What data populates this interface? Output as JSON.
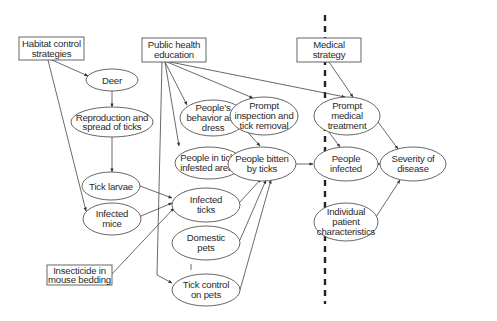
{
  "diagram": {
    "divider": {
      "style": "dashed",
      "x": 325
    },
    "nodes": {
      "habitat_control": {
        "shape": "box",
        "lines": [
          "Habitat control",
          "strategies"
        ]
      },
      "public_health": {
        "shape": "box",
        "lines": [
          "Public health",
          "education"
        ]
      },
      "medical_strategy": {
        "shape": "box",
        "lines": [
          "Medical",
          "strategy"
        ]
      },
      "insecticide": {
        "shape": "box",
        "lines": [
          "Insecticide in",
          "mouse bedding"
        ]
      },
      "deer": {
        "shape": "ellipse",
        "lines": [
          "Deer"
        ]
      },
      "reproduction": {
        "shape": "ellipse",
        "lines": [
          "Reproduction and",
          "spread of ticks"
        ]
      },
      "tick_larvae": {
        "shape": "ellipse",
        "lines": [
          "Tick larvae"
        ]
      },
      "infected_mice": {
        "shape": "ellipse",
        "lines": [
          "Infected",
          "mice"
        ]
      },
      "behavior_dress": {
        "shape": "ellipse",
        "lines": [
          "People’s",
          "behavior and",
          "dress"
        ]
      },
      "prompt_inspection": {
        "shape": "ellipse",
        "lines": [
          "Prompt",
          "inspection and",
          "tick removal"
        ]
      },
      "tick_infested_areas": {
        "shape": "ellipse",
        "lines": [
          "People in tick-",
          "infested areas"
        ]
      },
      "people_bitten": {
        "shape": "ellipse",
        "lines": [
          "People bitten",
          "by ticks"
        ]
      },
      "infected_ticks": {
        "shape": "ellipse",
        "lines": [
          "Infected",
          "ticks"
        ]
      },
      "domestic_pets": {
        "shape": "ellipse",
        "lines": [
          "Domestic",
          "pets"
        ]
      },
      "tick_control_pets": {
        "shape": "ellipse",
        "lines": [
          "Tick control",
          "on pets"
        ]
      },
      "prompt_medical": {
        "shape": "ellipse",
        "lines": [
          "Prompt",
          "medical",
          "treatment"
        ]
      },
      "people_infected": {
        "shape": "ellipse",
        "lines": [
          "People",
          "infected"
        ]
      },
      "severity": {
        "shape": "ellipse",
        "lines": [
          "Severity of",
          "disease"
        ]
      },
      "patient_characteristics": {
        "shape": "ellipse",
        "lines": [
          "Individual",
          "patient",
          "characteristics"
        ]
      }
    },
    "edges": [
      {
        "from": "habitat_control",
        "to": "deer"
      },
      {
        "from": "habitat_control",
        "to": "infected_mice"
      },
      {
        "from": "deer",
        "to": "reproduction"
      },
      {
        "from": "reproduction",
        "to": "tick_larvae"
      },
      {
        "from": "tick_larvae",
        "to": "infected_ticks"
      },
      {
        "from": "infected_mice",
        "to": "infected_ticks"
      },
      {
        "from": "insecticide",
        "to": "infected_ticks"
      },
      {
        "from": "public_health",
        "to": "behavior_dress"
      },
      {
        "from": "public_health",
        "to": "tick_infested_areas"
      },
      {
        "from": "public_health",
        "to": "prompt_inspection"
      },
      {
        "from": "public_health",
        "to": "prompt_medical"
      },
      {
        "from": "public_health",
        "to": "tick_control_pets"
      },
      {
        "from": "behavior_dress",
        "to": "people_bitten"
      },
      {
        "from": "tick_infested_areas",
        "to": "people_bitten"
      },
      {
        "from": "prompt_inspection",
        "to": "people_infected"
      },
      {
        "from": "infected_ticks",
        "to": "people_bitten"
      },
      {
        "from": "domestic_pets",
        "to": "people_bitten"
      },
      {
        "from": "tick_control_pets",
        "to": "people_bitten"
      },
      {
        "from": "people_bitten",
        "to": "people_infected"
      },
      {
        "from": "medical_strategy",
        "to": "prompt_medical"
      },
      {
        "from": "prompt_medical",
        "to": "severity"
      },
      {
        "from": "people_infected",
        "to": "severity"
      },
      {
        "from": "patient_characteristics",
        "to": "severity"
      }
    ]
  }
}
